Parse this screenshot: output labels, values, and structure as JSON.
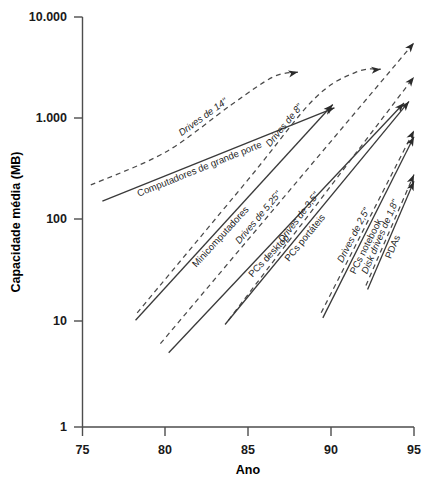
{
  "chart_data": {
    "type": "line",
    "title": "",
    "xlabel": "Ano",
    "ylabel": "Capacidade média (MB)",
    "xlim": [
      75,
      95
    ],
    "ylim": [
      1,
      10000
    ],
    "yscale": "log",
    "grid": false,
    "legend_position": "inline-labels",
    "x_ticks": [
      "75",
      "80",
      "85",
      "90",
      "95"
    ],
    "x_tick_values": [
      75,
      80,
      85,
      90,
      95
    ],
    "y_ticks": [
      "1",
      "10",
      "100",
      "1.000",
      "10.000"
    ],
    "y_tick_values": [
      1,
      10,
      100,
      1000,
      10000
    ],
    "series": [
      {
        "name": "Drives de 14\"",
        "style": "dashed",
        "italic": true,
        "label": "Drives de 14\"",
        "points": [
          [
            75.5,
            230
          ],
          [
            80,
            480
          ],
          [
            84,
            1400
          ],
          [
            86.5,
            2600
          ],
          [
            88,
            2900
          ]
        ],
        "end_value": 2900
      },
      {
        "name": "Computadores de grande porte",
        "style": "solid",
        "italic": false,
        "label": "Computadores de grande porte",
        "points": [
          [
            76.2,
            160
          ],
          [
            90.2,
            1300
          ]
        ],
        "end_value": 1300
      },
      {
        "name": "Drives de 8\"",
        "style": "dashed",
        "italic": true,
        "label": "Drives de 8\"",
        "points": [
          [
            78.3,
            13
          ],
          [
            85,
            260
          ],
          [
            89,
            1600
          ],
          [
            91.5,
            2900
          ],
          [
            93,
            3100
          ]
        ],
        "end_value": 3100
      },
      {
        "name": "Minicomputadores",
        "style": "solid",
        "italic": false,
        "label": "Minicomputadores",
        "points": [
          [
            78.2,
            11
          ],
          [
            90.1,
            1400
          ]
        ],
        "end_value": 1400
      },
      {
        "name": "Drives de 5,25\"",
        "style": "dashed",
        "italic": true,
        "label": "Drives de 5,25\"",
        "points": [
          [
            79.7,
            6.5
          ],
          [
            95,
            5600
          ]
        ],
        "end_value": 5600
      },
      {
        "name": "PCs desktop",
        "style": "solid",
        "italic": false,
        "label": "PCs desktop",
        "points": [
          [
            80.2,
            5.3
          ],
          [
            94.4,
            1450
          ]
        ],
        "end_value": 1450
      },
      {
        "name": "Drives de 3,5\"",
        "style": "dashed",
        "italic": true,
        "label": "Drives de 3,5\"",
        "points": [
          [
            83.8,
            11
          ],
          [
            95,
            2600
          ]
        ],
        "end_value": 2600
      },
      {
        "name": "PCs portáteis",
        "style": "solid",
        "italic": false,
        "label": "PCs portáteis",
        "points": [
          [
            83.6,
            10
          ],
          [
            94.7,
            1500
          ]
        ],
        "end_value": 1500
      },
      {
        "name": "Drives de 2,5\"",
        "style": "dashed",
        "italic": true,
        "label": "Drives de 2,5\"",
        "points": [
          [
            89.4,
            13
          ],
          [
            95,
            780
          ]
        ],
        "end_value": 780
      },
      {
        "name": "PCs notebook",
        "style": "solid",
        "italic": false,
        "label": "PCs notebook",
        "points": [
          [
            89.5,
            11.6
          ],
          [
            95,
            680
          ]
        ],
        "end_value": 680
      },
      {
        "name": "Disk drives de 1,8\"",
        "style": "dashed",
        "italic": true,
        "label": "Disk drives de 1,8\"",
        "points": [
          [
            92.1,
            24
          ],
          [
            95,
            290
          ]
        ],
        "end_value": 290
      },
      {
        "name": "PDAs",
        "style": "solid",
        "italic": false,
        "label": "PDAs",
        "points": [
          [
            92.2,
            22
          ],
          [
            95,
            250
          ]
        ],
        "end_value": 250
      }
    ]
  }
}
